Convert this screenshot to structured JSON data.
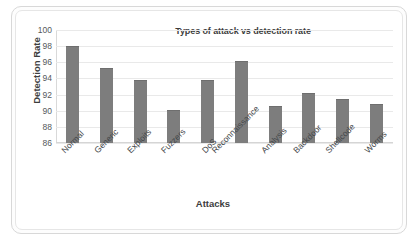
{
  "chart_data": {
    "type": "bar",
    "title": "Types of attack vs detection rate",
    "xlabel": "Attacks",
    "ylabel": "Detection Rate",
    "categories": [
      "Normal",
      "Generic",
      "Exploits",
      "Fuzzers",
      "DoS",
      "Reconnaissance",
      "Analysis",
      "Backdoor",
      "Shellcode",
      "Worms"
    ],
    "values": [
      98.0,
      95.3,
      93.8,
      90.1,
      93.8,
      96.2,
      90.6,
      92.2,
      91.5,
      90.8
    ],
    "ylim": [
      86,
      100
    ],
    "yticks": [
      86,
      88,
      90,
      92,
      94,
      96,
      98,
      100
    ],
    "grid": true,
    "legend": "none",
    "bar_color": "#7d7d7d"
  }
}
